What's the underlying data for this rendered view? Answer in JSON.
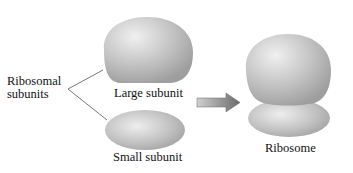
{
  "labels": {
    "ribosomal_subunits_line1": "Ribosomal",
    "ribosomal_subunits_line2": "subunits",
    "large_subunit": "Large subunit",
    "small_subunit": "Small subunit",
    "ribosome": "Ribosome"
  },
  "colors": {
    "subunit_fill": "#b8b8b8",
    "highlight": "#ececec",
    "arrow": "#7a7a7a",
    "connector": "#555555"
  }
}
